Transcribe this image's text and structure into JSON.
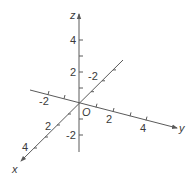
{
  "diagram": {
    "type": "3d-axes",
    "line_color": "#5a5a5a",
    "text_color": "#3a3a3a",
    "origin_label": "O",
    "axes": {
      "x": {
        "label": "x",
        "tick_labels": [
          "4",
          "2",
          "-2"
        ]
      },
      "y": {
        "label": "y",
        "tick_labels": [
          "-2",
          "2",
          "4"
        ]
      },
      "z": {
        "label": "z",
        "tick_labels": [
          "4",
          "2",
          "-2"
        ]
      }
    }
  }
}
